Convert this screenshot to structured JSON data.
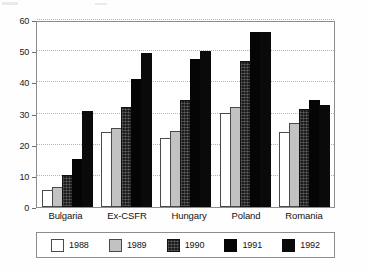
{
  "chart_data": {
    "type": "bar",
    "title": "",
    "subtitle": "",
    "xlabel": "",
    "ylabel": "",
    "ylim": [
      0,
      60
    ],
    "yticks": [
      0,
      10,
      20,
      30,
      40,
      50,
      60
    ],
    "grid": true,
    "legend_position": "bottom",
    "categories": [
      "Bulgaria",
      "Ex-CSFR",
      "Hungary",
      "Poland",
      "Romania"
    ],
    "series": [
      {
        "name": "1988",
        "color": "#ffffff",
        "values": [
          5.5,
          24.0,
          22.2,
          30.3,
          24.2
        ]
      },
      {
        "name": "1989",
        "color": "#c2c2c2",
        "values": [
          6.5,
          25.5,
          24.3,
          32.1,
          26.8
        ]
      },
      {
        "name": "1990",
        "color": "#1c1c1c",
        "values": [
          10.3,
          32.0,
          34.3,
          47.0,
          31.3
        ]
      },
      {
        "name": "1991",
        "color": "#050505",
        "values": [
          15.3,
          41.0,
          47.6,
          56.2,
          34.2
        ]
      },
      {
        "name": "1992",
        "color": "#0a0a0a",
        "values": [
          30.8,
          49.5,
          50.0,
          56.2,
          32.6
        ]
      }
    ]
  }
}
